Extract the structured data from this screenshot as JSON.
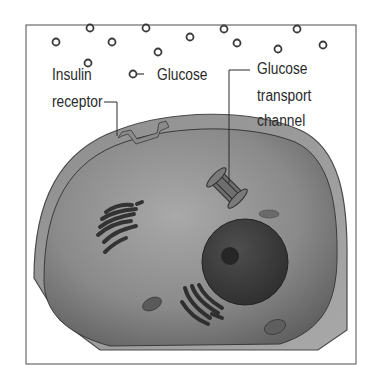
{
  "figure": {
    "type": "cell-diagram",
    "frame_color": "#6a6a6a",
    "background": "#ffffff"
  },
  "labels": {
    "insulin_receptor": {
      "line1": "Insulin",
      "line2": "receptor"
    },
    "glucose": "Glucose",
    "glucose_transport_channel": {
      "line1": "Glucose",
      "line2": "transport",
      "line3": "channel"
    }
  },
  "glucose_molecules": [
    [
      56,
      42
    ],
    [
      90,
      28
    ],
    [
      112,
      42
    ],
    [
      146,
      28
    ],
    [
      158,
      52
    ],
    [
      88,
      63
    ],
    [
      190,
      37
    ],
    [
      224,
      29
    ],
    [
      237,
      43
    ],
    [
      278,
      49
    ],
    [
      297,
      29
    ],
    [
      323,
      45
    ]
  ],
  "legend_glucose_icon": [
    133,
    74
  ],
  "colors": {
    "membrane": "#8c8c8c",
    "cytoplasm": "#7a7a7a",
    "nucleus": "#3e3e3e",
    "nucleolus": "#2a2a2a",
    "organelle": "#3a3a3a",
    "text": "#2a2a2a"
  },
  "structures": {
    "nucleus": "nucleus",
    "nucleolus": "nucleolus",
    "golgi": "golgi apparatus",
    "er": "endoplasmic reticulum",
    "mitochondria": "mitochondria"
  }
}
